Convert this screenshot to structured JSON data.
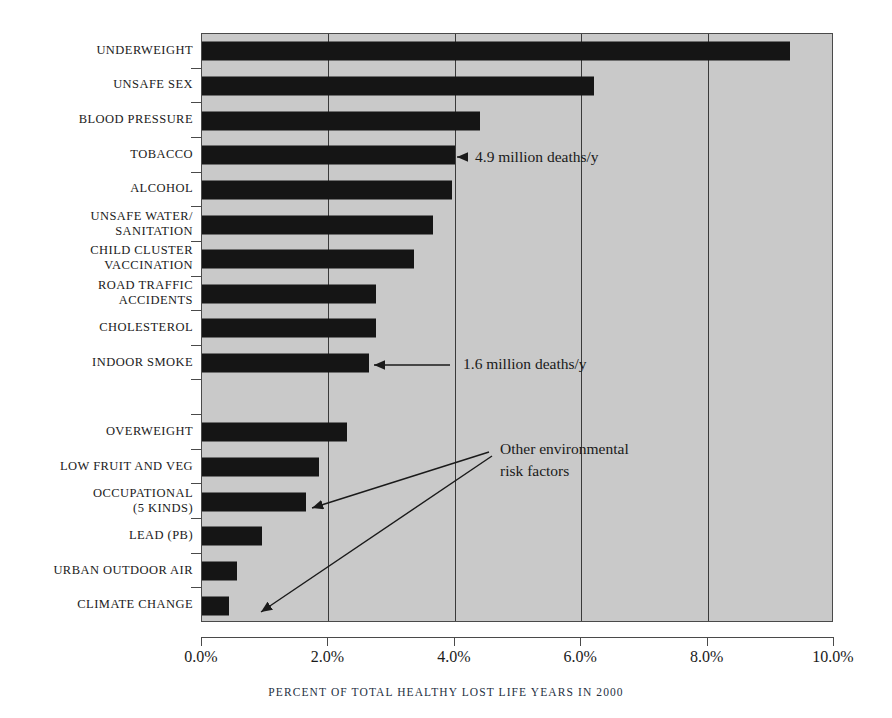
{
  "chart_data": {
    "type": "bar",
    "orientation": "horizontal",
    "title": "",
    "subtitle": "",
    "xlabel": "PERCENT OF TOTAL HEALTHY LOST LIFE YEARS IN 2000",
    "ylabel": "",
    "xlim": [
      0,
      10
    ],
    "xunit": "%",
    "grid": true,
    "legend": "none",
    "xticks": [
      "0.0%",
      "2.0%",
      "4.0%",
      "6.0%",
      "8.0%",
      "10.0%"
    ],
    "xtick_values": [
      0,
      2,
      4,
      6,
      8,
      10
    ],
    "categories": [
      "UNDERWEIGHT",
      "UNSAFE SEX",
      "BLOOD PRESSURE",
      "TOBACCO",
      "ALCOHOL",
      "UNSAFE WATER/ SANITATION",
      "CHILD CLUSTER VACCINATION",
      "ROAD TRAFFIC ACCIDENTS",
      "CHOLESTEROL",
      "INDOOR SMOKE",
      "",
      "OVERWEIGHT",
      "LOW FRUIT AND VEG",
      "OCCUPATIONAL (5 KINDS)",
      "LEAD (PB)",
      "URBAN OUTDOOR AIR",
      "CLIMATE CHANGE"
    ],
    "values": [
      9.3,
      6.2,
      4.4,
      4.0,
      3.95,
      3.65,
      3.35,
      2.75,
      2.75,
      2.65,
      null,
      2.3,
      1.85,
      1.65,
      0.95,
      0.55,
      0.43
    ],
    "bar_color": "#151515",
    "plot_background": "#c9c9c9"
  },
  "ylabels": [
    {
      "line1": "UNDERWEIGHT",
      "line2": ""
    },
    {
      "line1": "UNSAFE SEX",
      "line2": ""
    },
    {
      "line1": "BLOOD PRESSURE",
      "line2": ""
    },
    {
      "line1": "TOBACCO",
      "line2": ""
    },
    {
      "line1": "ALCOHOL",
      "line2": ""
    },
    {
      "line1": "UNSAFE WATER/",
      "line2": "SANITATION"
    },
    {
      "line1": "CHILD CLUSTER",
      "line2": "VACCINATION"
    },
    {
      "line1": "ROAD TRAFFIC",
      "line2": "ACCIDENTS"
    },
    {
      "line1": "CHOLESTEROL",
      "line2": ""
    },
    {
      "line1": "INDOOR SMOKE",
      "line2": ""
    },
    {
      "line1": "",
      "line2": ""
    },
    {
      "line1": "OVERWEIGHT",
      "line2": ""
    },
    {
      "line1": "LOW FRUIT AND VEG",
      "line2": ""
    },
    {
      "line1": "OCCUPATIONAL",
      "line2": "(5 KINDS)"
    },
    {
      "line1": "LEAD (PB)",
      "line2": ""
    },
    {
      "line1": "URBAN OUTDOOR AIR",
      "line2": ""
    },
    {
      "line1": "CLIMATE CHANGE",
      "line2": ""
    }
  ],
  "annotations": {
    "tobacco_deaths": "4.9 million deaths/y",
    "indoor_smoke_deaths": "1.6 million deaths/y",
    "other_env_line1": "Other environmental",
    "other_env_line2": "risk factors"
  },
  "axis": {
    "caption": "PERCENT OF TOTAL HEALTHY LOST LIFE YEARS IN 2000",
    "tick_0": "0.0%",
    "tick_1": "2.0%",
    "tick_2": "4.0%",
    "tick_3": "6.0%",
    "tick_4": "8.0%",
    "tick_5": "10.0%"
  }
}
